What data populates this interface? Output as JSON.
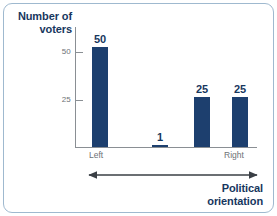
{
  "chart_data": {
    "type": "bar",
    "title": "",
    "categories": [
      "Left",
      "",
      "",
      "Right"
    ],
    "values": [
      50,
      1,
      25,
      25
    ],
    "series": [
      {
        "name": "Number of voters",
        "values": [
          50,
          1,
          25,
          25
        ]
      }
    ],
    "data_labels": [
      "50",
      "1",
      "25",
      "25"
    ],
    "xlabel": "Political orientation",
    "ylabel": "Number of voters",
    "ylim": [
      0,
      60
    ],
    "yticks": [
      25,
      50
    ],
    "ytick_labels": [
      "25",
      "50"
    ],
    "grid": false,
    "legend": false,
    "x_axis_kind": "continuous-spectrum-arrow",
    "x_axis_endpoints": [
      "Left",
      "Right"
    ]
  },
  "axes": {
    "y_title_line1": "Number of",
    "y_title_line2": "voters",
    "x_title_line1": "Political",
    "x_title_line2": "orientation",
    "ytick_50": "50",
    "ytick_25": "25",
    "cat_left": "Left",
    "cat_right": "Right"
  },
  "bars": [
    {
      "label": "50",
      "value": 50,
      "x": 17,
      "width": 16
    },
    {
      "label": "1",
      "value": 1,
      "x": 77,
      "width": 16
    },
    {
      "label": "25",
      "value": 25,
      "x": 119,
      "width": 16
    },
    {
      "label": "25",
      "value": 25,
      "x": 157,
      "width": 16
    }
  ],
  "colors": {
    "bar": "#1d3f6e",
    "bar_label": "#17375e",
    "axis": "#8a8f94",
    "tick_text": "#6d7276",
    "frame": "#9fb9cf",
    "background": "#ffffff"
  }
}
